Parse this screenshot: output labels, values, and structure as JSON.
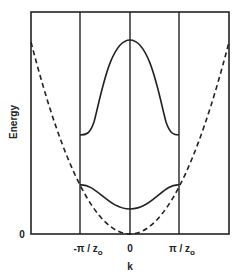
{
  "diagram": {
    "title": "",
    "y_axis_label": "Energy",
    "y_origin_label": "0",
    "x_axis_label": "k",
    "x_tick_labels": [
      {
        "base": "-π / z",
        "sub": "o"
      },
      {
        "base": "0",
        "sub": ""
      },
      {
        "base": "π / z",
        "sub": "o"
      }
    ],
    "curves": [
      {
        "name": "free-electron-parabola",
        "style": "dashed"
      },
      {
        "name": "lower-band",
        "style": "solid"
      },
      {
        "name": "upper-band",
        "style": "solid"
      }
    ],
    "line_color": "#222222",
    "background_color": "#ffffff"
  }
}
